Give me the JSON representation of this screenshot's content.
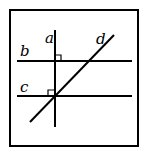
{
  "diagram": {
    "labels": {
      "a": "a",
      "b": "b",
      "c": "c",
      "d": "d"
    },
    "lines": [
      {
        "name": "a",
        "orientation": "vertical"
      },
      {
        "name": "b",
        "orientation": "horizontal"
      },
      {
        "name": "c",
        "orientation": "horizontal"
      },
      {
        "name": "d",
        "orientation": "diagonal"
      }
    ],
    "right_angle_marks": 2,
    "stroke_color": "#000000"
  }
}
